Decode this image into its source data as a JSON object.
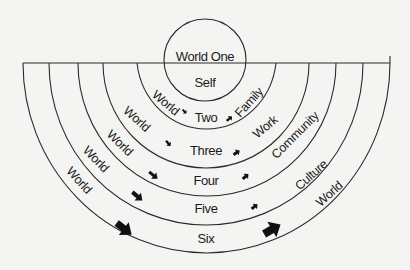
{
  "diagram": {
    "type": "concentric-semicircle",
    "colors": {
      "line": "#2a2a2a",
      "text": "#1a1a1a",
      "background": "#f4f4f2"
    },
    "core": {
      "title": "World One",
      "subtitle": "Self"
    },
    "rings": [
      {
        "number": "Two",
        "left": "World",
        "right": "Family"
      },
      {
        "number": "Three",
        "left": "World",
        "right": "Work"
      },
      {
        "number": "Four",
        "left": "World",
        "right": "Community"
      },
      {
        "number": "Five",
        "left": "World",
        "right": "Culture"
      },
      {
        "number": "Six",
        "left": "World",
        "right": "World"
      }
    ]
  }
}
